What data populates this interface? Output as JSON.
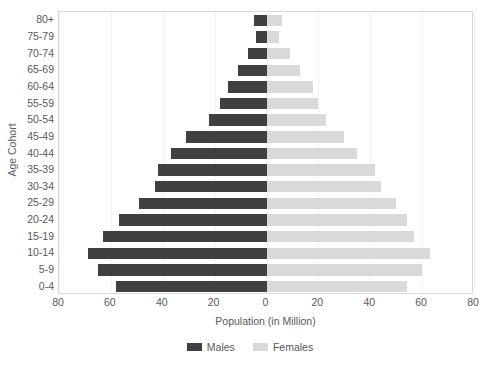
{
  "chart_data": {
    "type": "bar",
    "subtype": "population-pyramid",
    "title": "",
    "xlabel": "Population (in Million)",
    "ylabel": "Age Cohort",
    "categories": [
      "0-4",
      "5-9",
      "10-14",
      "15-19",
      "20-24",
      "25-29",
      "30-34",
      "35-39",
      "40-44",
      "45-49",
      "50-54",
      "55-59",
      "60-64",
      "65-69",
      "70-74",
      "75-79",
      "80+"
    ],
    "categories_top_down": [
      "80+",
      "75-79",
      "70-74",
      "65-69",
      "60-64",
      "55-59",
      "50-54",
      "45-49",
      "40-44",
      "35-39",
      "30-34",
      "25-29",
      "20-24",
      "15-19",
      "10-14",
      "5-9",
      "0-4"
    ],
    "series": [
      {
        "name": "Males",
        "color": "#404040",
        "direction": "left",
        "values": [
          58,
          65,
          69,
          63,
          57,
          49,
          43,
          42,
          37,
          31,
          22,
          18,
          15,
          11,
          7,
          4,
          5
        ]
      },
      {
        "name": "Females",
        "color": "#d9d9d9",
        "direction": "right",
        "values": [
          54,
          60,
          63,
          57,
          54,
          50,
          44,
          42,
          35,
          30,
          23,
          20,
          18,
          13,
          9,
          5,
          6
        ]
      }
    ],
    "xticks": [
      80,
      60,
      40,
      20,
      0,
      20,
      40,
      60,
      80
    ],
    "xlim": [
      -80,
      80
    ],
    "xtick_step": 20,
    "grid": true,
    "legend_position": "bottom",
    "legend": [
      "Males",
      "Females"
    ]
  },
  "axis": {
    "y_title": "Age Cohort",
    "x_title": "Population (in Million)"
  },
  "legend": {
    "males_label": "Males",
    "females_label": "Females",
    "males_color": "#404040",
    "females_color": "#d9d9d9"
  }
}
